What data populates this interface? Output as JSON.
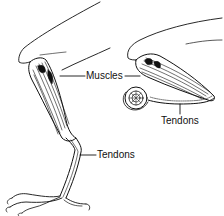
{
  "diagram": {
    "views": [
      {
        "id": "standing-leg",
        "description": "Extended leg with foot grasping, side view"
      },
      {
        "id": "perched-leg",
        "description": "Folded leg with toes curled around a perch"
      }
    ],
    "labels": {
      "muscles": "Muscles",
      "tendons_left": "Tendons",
      "tendons_right": "Tendons"
    },
    "colors": {
      "ink": "#111111",
      "background": "#ffffff"
    }
  }
}
